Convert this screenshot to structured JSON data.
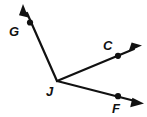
{
  "figure": {
    "type": "geometry-angle-diagram",
    "background_color": "#ffffff",
    "stroke_color": "#111111",
    "stroke_width": 2,
    "canvas": {
      "width": 147,
      "height": 117
    }
  },
  "vertex": {
    "name": "J",
    "label": "J",
    "x": 57,
    "y": 81,
    "label_x": 48,
    "label_y": 95
  },
  "rays": [
    {
      "id": "ray-jg",
      "label": "G",
      "from": "J",
      "start": {
        "x": 57,
        "y": 81
      },
      "end": {
        "x": 23,
        "y": 5
      },
      "point": {
        "x": 30,
        "y": 22
      },
      "label_x": 9,
      "label_y": 36,
      "has_arrowhead": true,
      "has_point_dot": true,
      "direction": "upper-left"
    },
    {
      "id": "ray-jc",
      "label": "C",
      "from": "J",
      "start": {
        "x": 57,
        "y": 81
      },
      "end": {
        "x": 141,
        "y": 46
      },
      "point": {
        "x": 118,
        "y": 56
      },
      "label_x": 103,
      "label_y": 50,
      "has_arrowhead": true,
      "has_point_dot": true,
      "direction": "upper-right"
    },
    {
      "id": "ray-jf",
      "label": "F",
      "from": "J",
      "start": {
        "x": 57,
        "y": 81
      },
      "end": {
        "x": 143,
        "y": 103
      },
      "point": {
        "x": 118,
        "y": 96
      },
      "label_x": 112,
      "label_y": 113,
      "has_arrowhead": true,
      "has_point_dot": true,
      "direction": "lower-right"
    }
  ],
  "labels": {
    "g": "G",
    "c": "C",
    "f": "F",
    "j": "J"
  }
}
